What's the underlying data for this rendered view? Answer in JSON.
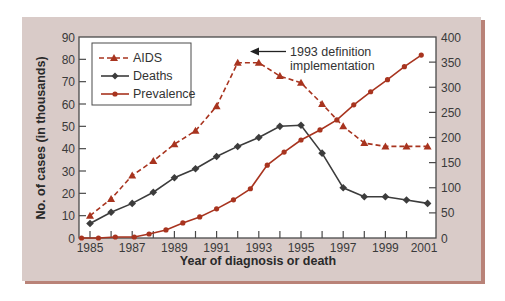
{
  "chart_data": {
    "type": "line",
    "title": "",
    "xlabel": "Year of diagnosis or death",
    "ylabel": "No. of cases (in thousands)",
    "ylabel_right": "",
    "x_ticks_labeled": [
      "1985",
      "1987",
      "1989",
      "1991",
      "1993",
      "1995",
      "1997",
      "1999",
      "2001"
    ],
    "xlim": [
      1984.6,
      2001.5
    ],
    "ylim": [
      0,
      90
    ],
    "ylim_right": [
      0,
      400
    ],
    "y_ticks": [
      0,
      10,
      20,
      30,
      40,
      50,
      60,
      70,
      80,
      90
    ],
    "y_ticks_right": [
      0,
      50,
      100,
      150,
      200,
      250,
      300,
      350,
      400
    ],
    "grid": false,
    "legend_position": "upper left",
    "annotation": {
      "lines": [
        "1993 definition",
        "implementation"
      ],
      "arrow_direction": "left",
      "points_to_year": 1993
    },
    "series": [
      {
        "name": "AIDS",
        "axis": "left",
        "style": "dashed",
        "marker": "triangle",
        "color": "#a8341f",
        "x": [
          1985,
          1986,
          1987,
          1988,
          1989,
          1990,
          1991,
          1992,
          1993,
          1994,
          1995,
          1996,
          1997,
          1998,
          1999,
          2000,
          2001
        ],
        "values": [
          10,
          17.5,
          28,
          34.5,
          42,
          48,
          59,
          78.5,
          78.5,
          72.5,
          69.5,
          60,
          50,
          42.5,
          41,
          41,
          41
        ]
      },
      {
        "name": "Deaths",
        "axis": "left",
        "style": "solid",
        "marker": "diamond",
        "color": "#3c3c3c",
        "x": [
          1985,
          1986,
          1987,
          1988,
          1989,
          1990,
          1991,
          1992,
          1993,
          1994,
          1995,
          1996,
          1997,
          1998,
          1999,
          2000,
          2001
        ],
        "values": [
          6.5,
          11.5,
          15.5,
          20.5,
          27,
          31,
          36.5,
          41,
          45,
          50,
          50.5,
          38,
          22.5,
          18.5,
          18.5,
          17,
          15.5
        ]
      },
      {
        "name": "Prevalence",
        "axis": "right",
        "style": "solid",
        "marker": "circle",
        "color": "#a8341f",
        "x": [
          1984.6,
          1985.4,
          1986.2,
          1987.1,
          1987.8,
          1988.6,
          1989.4,
          1990.2,
          1991.0,
          1991.8,
          1992.6,
          1993.4,
          1994.2,
          1995.0,
          1995.9,
          1996.7,
          1997.5,
          1998.3,
          1999.1,
          1999.9,
          2000.7
        ],
        "values": [
          0,
          0,
          2,
          2,
          8,
          16,
          30,
          42,
          58,
          76,
          98,
          145,
          171,
          195,
          215,
          235,
          265,
          291,
          315,
          341,
          364
        ]
      }
    ]
  },
  "legend": {
    "items": [
      "AIDS",
      "Deaths",
      "Prevalence"
    ]
  },
  "colors": {
    "frame_bg": "#d9cbc8",
    "frame_shadow": "#b98378",
    "plot_bg": "#ffffff",
    "axis": "#4a4a4a",
    "aids": "#a8341f",
    "deaths": "#3c3c3c",
    "prevalence": "#a8341f"
  }
}
